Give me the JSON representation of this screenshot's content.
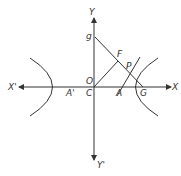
{
  "diagram": {
    "type": "hyperbola-geometry",
    "labels": {
      "y_axis_top": "Y",
      "y_axis_bottom": "Y'",
      "x_axis_right": "X",
      "x_axis_left": "X'",
      "origin_O": "O",
      "center_C": "C",
      "vertex_A": "A",
      "vertex_A_prime": "A'",
      "point_P": "P",
      "point_F": "F",
      "point_G": "G",
      "point_g": "g"
    },
    "colors": {
      "line": "#333333",
      "background": "#ffffff"
    }
  }
}
